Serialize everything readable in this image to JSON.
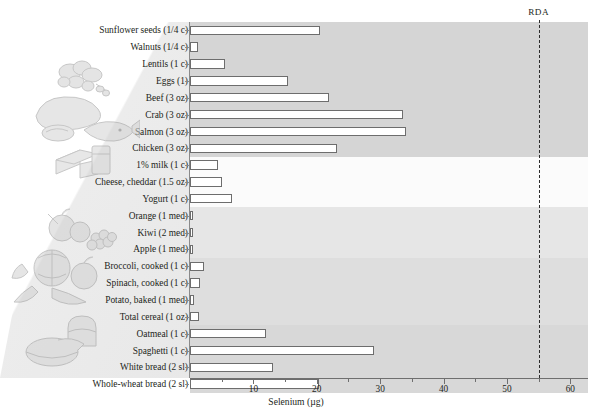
{
  "chart_data": {
    "type": "bar",
    "orientation": "horizontal",
    "title": "",
    "xlabel": "Selenium (µg)",
    "ylabel": "",
    "xlim": [
      0,
      62
    ],
    "xticks": [
      0,
      10,
      20,
      30,
      40,
      50,
      60
    ],
    "xtick_labels": [
      "",
      "10",
      "20",
      "30",
      "40",
      "50",
      "60"
    ],
    "minor_tick_step": 5,
    "grid": false,
    "legend": "none",
    "reference_line": {
      "label": "RDA",
      "value": 55,
      "style": "dashed"
    },
    "categories": [
      "Sunflower seeds (1/4 c)",
      "Walnuts (1/4 c)",
      "Lentils (1 c)",
      "Eggs (1)",
      "Beef (3 oz)",
      "Crab (3 oz)",
      "Salmon (3 oz)",
      "Chicken (3 oz)",
      "1% milk (1 c)",
      "Cheese, cheddar (1.5 oz)",
      "Yogurt (1 c)",
      "Orange (1 med)",
      "Kiwi (2 med)",
      "Apple (1 med)",
      "Broccoli, cooked (1 c)",
      "Spinach, cooked (1 c)",
      "Potato, baked (1 med)",
      "Total cereal (1 oz)",
      "Oatmeal (1 c)",
      "Spaghetti (1 c)",
      "White bread (2 sl)",
      "Whole-wheat bread (2 sl)"
    ],
    "values": [
      20.5,
      1.3,
      5.5,
      15.4,
      22.0,
      33.6,
      34.0,
      23.2,
      4.4,
      5.0,
      6.6,
      0.4,
      0.4,
      0.4,
      2.2,
      1.6,
      0.6,
      1.4,
      12.0,
      29.0,
      13.1,
      20.3
    ],
    "groups": [
      {
        "name": "protein-foods",
        "rows": 8,
        "shade": "#d5d5d5"
      },
      {
        "name": "dairy",
        "rows": 3,
        "shade": "#fbfbfb"
      },
      {
        "name": "fruits",
        "rows": 3,
        "shade": "#e6e6e6"
      },
      {
        "name": "vegetables",
        "rows": 4,
        "shade": "#dedede"
      },
      {
        "name": "grains",
        "rows": 4,
        "shade": "#d8d8d8"
      }
    ]
  },
  "illustrations": [
    {
      "name": "nuts-seeds-illustration"
    },
    {
      "name": "poultry-fish-illustration"
    },
    {
      "name": "cheese-milk-illustration"
    },
    {
      "name": "fruit-illustration"
    },
    {
      "name": "vegetables-illustration"
    },
    {
      "name": "bread-cereal-illustration"
    }
  ],
  "colors": {
    "bar_fill": "#ffffff",
    "bar_stroke": "#6d6d6d",
    "axis": "#6f6f6f",
    "text": "#231f20",
    "reference_line": "#2c2c2c",
    "background": "#ffffff"
  }
}
